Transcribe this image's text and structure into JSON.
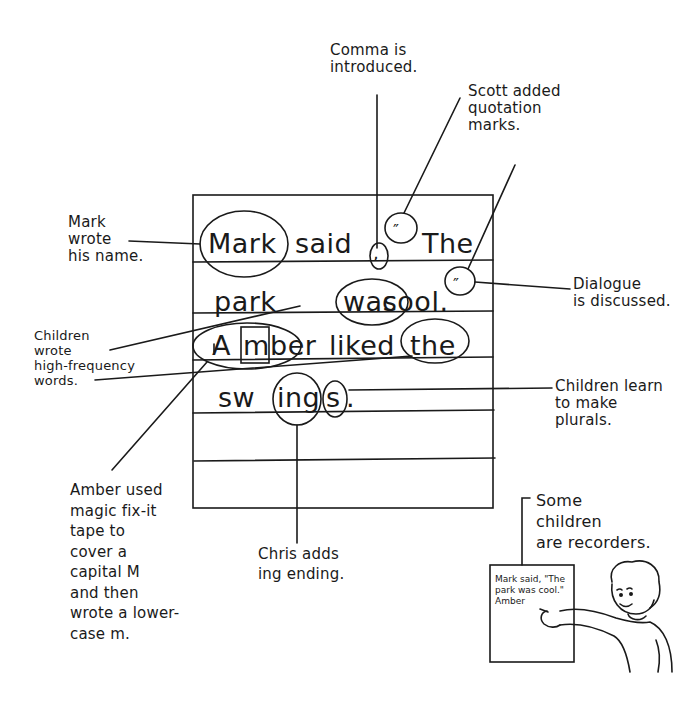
{
  "chart": {
    "lines": [
      {
        "words": [
          "Mark",
          "said",
          "The"
        ],
        "comma": ",",
        "open_quote": "”",
        "raw": "Mark said, \"The"
      },
      {
        "words": [
          "park",
          "was",
          "cool."
        ],
        "close_quote": "”",
        "raw": "park was cool.\""
      },
      {
        "words": [
          "A",
          "m",
          "ber",
          "liked",
          "the"
        ],
        "raw": "Amber liked the"
      },
      {
        "words": [
          "sw",
          "ing",
          "s",
          "."
        ],
        "raw": "swings."
      }
    ],
    "quote_mark_symbol": "″",
    "comma_symbol": ","
  },
  "annotations": {
    "comma": "Comma is\nintroduced.",
    "quotes": "Scott added\nquotation\n  marks.",
    "mark": "Mark\nwrote\nhis name.",
    "dialogue": "Dialogue\nis discussed.",
    "hf_words": "Children\nwrote\nhigh-frequency\nwords.",
    "plurals": "Children learn\nto make\nplurals.",
    "amber": "Amber used\nmagic fix-it\ntape to\ncover a\ncapital M\nand then\nwrote a lower-\ncase m.",
    "chris": "Chris adds\ning ending.",
    "recorders": "Some\nchildren\nare recorders."
  },
  "recorder_paper": {
    "text": "Mark said, \"The\npark was cool.\"\nAmber"
  },
  "figures": {
    "child": "child-pointing-illustration"
  },
  "colors": {
    "ink": "#1a1a1a",
    "paper": "#ffffff"
  }
}
